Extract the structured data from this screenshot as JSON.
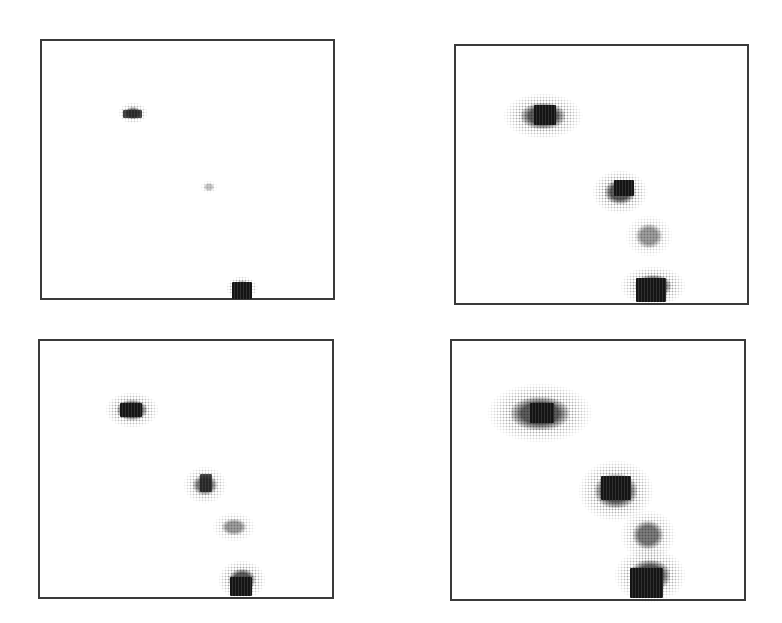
{
  "figure": {
    "background_color": "#ffffff",
    "border_color": "#3a3a3a",
    "ink_color": "#222222",
    "panels": [
      {
        "id": "top-left",
        "position": {
          "left": 40,
          "top": 39,
          "width": 295,
          "height": 261
        },
        "blobs": [
          {
            "label": "upper-spot",
            "core": {
              "x": 123,
              "y": 110,
              "w": 19,
              "h": 8
            },
            "halo": {
              "x": 118,
              "y": 102,
              "w": 30,
              "h": 22
            },
            "intensity": "medium"
          },
          {
            "label": "middle-trace",
            "core": null,
            "halo": {
              "x": 200,
              "y": 180,
              "w": 18,
              "h": 14
            },
            "intensity": "faint"
          },
          {
            "label": "bottom-block",
            "core": {
              "x": 232,
              "y": 282,
              "w": 20,
              "h": 17
            },
            "halo": {
              "x": 226,
              "y": 276,
              "w": 32,
              "h": 24
            },
            "intensity": "dark"
          }
        ]
      },
      {
        "id": "top-right",
        "position": {
          "left": 454,
          "top": 44,
          "width": 295,
          "height": 261
        },
        "blobs": [
          {
            "label": "upper-spot",
            "core": {
              "x": 534,
              "y": 105,
              "w": 22,
              "h": 20
            },
            "halo": {
              "x": 503,
              "y": 93,
              "w": 80,
              "h": 46
            },
            "intensity": "dark"
          },
          {
            "label": "second-spot",
            "core": {
              "x": 614,
              "y": 180,
              "w": 20,
              "h": 16
            },
            "halo": {
              "x": 592,
              "y": 170,
              "w": 56,
              "h": 44
            },
            "intensity": "dark"
          },
          {
            "label": "third-spot",
            "core": null,
            "halo": {
              "x": 625,
              "y": 215,
              "w": 48,
              "h": 42
            },
            "intensity": "light"
          },
          {
            "label": "bottom-block",
            "core": {
              "x": 636,
              "y": 278,
              "w": 30,
              "h": 24
            },
            "halo": {
              "x": 620,
              "y": 266,
              "w": 66,
              "h": 40
            },
            "intensity": "dark"
          }
        ]
      },
      {
        "id": "bottom-left",
        "position": {
          "left": 38,
          "top": 339,
          "width": 296,
          "height": 260
        },
        "blobs": [
          {
            "label": "upper-spot",
            "core": {
              "x": 120,
              "y": 403,
              "w": 22,
              "h": 14
            },
            "halo": {
              "x": 105,
              "y": 392,
              "w": 54,
              "h": 36
            },
            "intensity": "dark"
          },
          {
            "label": "second-spot",
            "core": {
              "x": 200,
              "y": 474,
              "w": 12,
              "h": 18
            },
            "halo": {
              "x": 183,
              "y": 466,
              "w": 44,
              "h": 38
            },
            "intensity": "medium"
          },
          {
            "label": "third-spot",
            "core": null,
            "halo": {
              "x": 212,
              "y": 512,
              "w": 44,
              "h": 30
            },
            "intensity": "light"
          },
          {
            "label": "bottom-block",
            "core": {
              "x": 230,
              "y": 577,
              "w": 22,
              "h": 19
            },
            "halo": {
              "x": 218,
              "y": 560,
              "w": 48,
              "h": 40
            },
            "intensity": "dark"
          }
        ]
      },
      {
        "id": "bottom-right",
        "position": {
          "left": 450,
          "top": 339,
          "width": 296,
          "height": 262
        },
        "blobs": [
          {
            "label": "upper-spot",
            "core": {
              "x": 530,
              "y": 403,
              "w": 24,
              "h": 20
            },
            "halo": {
              "x": 487,
              "y": 383,
              "w": 106,
              "h": 60
            },
            "intensity": "dark"
          },
          {
            "label": "second-spot",
            "core": {
              "x": 601,
              "y": 476,
              "w": 30,
              "h": 24
            },
            "halo": {
              "x": 578,
              "y": 460,
              "w": 76,
              "h": 62
            },
            "intensity": "dark"
          },
          {
            "label": "third-spot",
            "core": null,
            "halo": {
              "x": 620,
              "y": 510,
              "w": 56,
              "h": 50
            },
            "intensity": "medium"
          },
          {
            "label": "bottom-block",
            "core": {
              "x": 630,
              "y": 568,
              "w": 33,
              "h": 30
            },
            "halo": {
              "x": 614,
              "y": 548,
              "w": 72,
              "h": 55
            },
            "intensity": "dark"
          }
        ]
      }
    ]
  }
}
